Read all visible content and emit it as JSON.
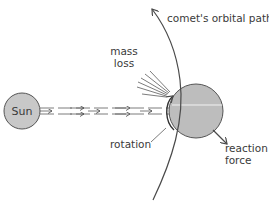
{
  "diagram": {
    "sun": {
      "label": "Sun",
      "fill": "#c8c8c8",
      "stroke": "#555555"
    },
    "comet": {
      "fill": "#bdbdbd",
      "stroke": "#555555"
    },
    "labels": {
      "orbital_path": "comet's orbital path",
      "mass_loss_line1": "mass",
      "mass_loss_line2": "loss",
      "rotation": "rotation",
      "reaction_line1": "reaction",
      "reaction_line2": "force"
    },
    "colors": {
      "line": "#4a4a4a",
      "text": "#3a3a3a",
      "background": "#ffffff"
    }
  }
}
